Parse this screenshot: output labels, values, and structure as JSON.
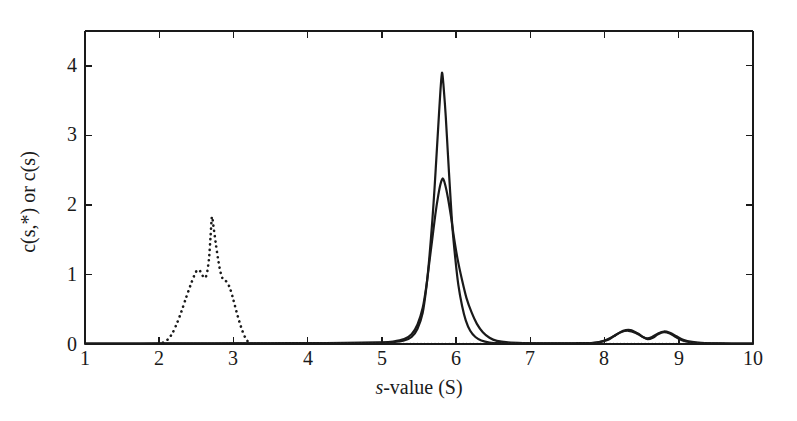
{
  "figure": {
    "background_color": "#ffffff",
    "axis_color": "#1a1a1a",
    "curve_color": "#1a1a1a"
  },
  "chart_data": {
    "type": "line",
    "title": "",
    "xlabel": "s-value (S)",
    "xlabel_italic_prefix": "s",
    "xlabel_rest": "-value (S)",
    "ylabel": "c(s,*) or c(s)",
    "xlim": [
      1,
      10
    ],
    "ylim": [
      0,
      4.5
    ],
    "xticks": [
      1,
      2,
      3,
      4,
      5,
      6,
      7,
      8,
      9,
      10
    ],
    "yticks": [
      0,
      1,
      2,
      3,
      4
    ],
    "xtick_labels": [
      "1",
      "2",
      "3",
      "4",
      "5",
      "6",
      "7",
      "8",
      "9",
      "10"
    ],
    "ytick_labels": [
      "0",
      "1",
      "2",
      "3",
      "4"
    ],
    "grid": false,
    "legend_position": "none",
    "tick_direction": "in",
    "frame": "box",
    "series": [
      {
        "name": "c(s*) distribution — tall solid",
        "style": "solid",
        "linewidth": 2.2,
        "color": "#1a1a1a",
        "peak_x": 5.81,
        "peak_y": 3.9,
        "points": [
          [
            1.0,
            0.004
          ],
          [
            1.5,
            0.005
          ],
          [
            2.0,
            0.006
          ],
          [
            2.5,
            0.007
          ],
          [
            3.0,
            0.008
          ],
          [
            3.5,
            0.009
          ],
          [
            4.0,
            0.01
          ],
          [
            4.5,
            0.012
          ],
          [
            5.0,
            0.018
          ],
          [
            5.15,
            0.025
          ],
          [
            5.3,
            0.05
          ],
          [
            5.4,
            0.1
          ],
          [
            5.48,
            0.22
          ],
          [
            5.55,
            0.45
          ],
          [
            5.6,
            0.82
          ],
          [
            5.64,
            1.25
          ],
          [
            5.68,
            1.78
          ],
          [
            5.71,
            2.25
          ],
          [
            5.74,
            2.78
          ],
          [
            5.77,
            3.32
          ],
          [
            5.79,
            3.66
          ],
          [
            5.81,
            3.9
          ],
          [
            5.83,
            3.72
          ],
          [
            5.86,
            3.28
          ],
          [
            5.89,
            2.72
          ],
          [
            5.92,
            2.18
          ],
          [
            5.95,
            1.68
          ],
          [
            5.99,
            1.22
          ],
          [
            6.03,
            0.85
          ],
          [
            6.08,
            0.55
          ],
          [
            6.13,
            0.34
          ],
          [
            6.19,
            0.19
          ],
          [
            6.26,
            0.1
          ],
          [
            6.34,
            0.05
          ],
          [
            6.45,
            0.022
          ],
          [
            6.6,
            0.012
          ],
          [
            6.9,
            0.008
          ],
          [
            7.3,
            0.008
          ],
          [
            7.7,
            0.01
          ],
          [
            7.9,
            0.02
          ],
          [
            8.05,
            0.06
          ],
          [
            8.15,
            0.13
          ],
          [
            8.25,
            0.19
          ],
          [
            8.35,
            0.2
          ],
          [
            8.45,
            0.15
          ],
          [
            8.52,
            0.1
          ],
          [
            8.58,
            0.07
          ],
          [
            8.65,
            0.09
          ],
          [
            8.72,
            0.14
          ],
          [
            8.8,
            0.17
          ],
          [
            8.88,
            0.15
          ],
          [
            8.96,
            0.1
          ],
          [
            9.05,
            0.05
          ],
          [
            9.15,
            0.025
          ],
          [
            9.3,
            0.012
          ],
          [
            9.5,
            0.008
          ],
          [
            9.75,
            0.006
          ],
          [
            10.0,
            0.005
          ]
        ]
      },
      {
        "name": "c(s) distribution — short solid",
        "style": "solid",
        "linewidth": 2.2,
        "color": "#1a1a1a",
        "peak_x": 5.82,
        "peak_y": 2.38,
        "points": [
          [
            1.0,
            0.006
          ],
          [
            1.5,
            0.007
          ],
          [
            2.0,
            0.008
          ],
          [
            2.5,
            0.009
          ],
          [
            3.0,
            0.01
          ],
          [
            3.5,
            0.011
          ],
          [
            4.0,
            0.013
          ],
          [
            4.5,
            0.016
          ],
          [
            5.0,
            0.024
          ],
          [
            5.15,
            0.035
          ],
          [
            5.3,
            0.07
          ],
          [
            5.4,
            0.14
          ],
          [
            5.48,
            0.28
          ],
          [
            5.55,
            0.52
          ],
          [
            5.6,
            0.84
          ],
          [
            5.64,
            1.18
          ],
          [
            5.68,
            1.52
          ],
          [
            5.72,
            1.86
          ],
          [
            5.76,
            2.14
          ],
          [
            5.79,
            2.3
          ],
          [
            5.82,
            2.38
          ],
          [
            5.85,
            2.3
          ],
          [
            5.89,
            2.1
          ],
          [
            5.93,
            1.84
          ],
          [
            5.97,
            1.54
          ],
          [
            6.02,
            1.22
          ],
          [
            6.08,
            0.92
          ],
          [
            6.14,
            0.66
          ],
          [
            6.21,
            0.45
          ],
          [
            6.28,
            0.29
          ],
          [
            6.36,
            0.17
          ],
          [
            6.45,
            0.09
          ],
          [
            6.55,
            0.045
          ],
          [
            6.7,
            0.022
          ],
          [
            6.9,
            0.013
          ],
          [
            7.2,
            0.01
          ],
          [
            7.6,
            0.011
          ],
          [
            7.85,
            0.018
          ],
          [
            8.0,
            0.05
          ],
          [
            8.12,
            0.11
          ],
          [
            8.22,
            0.17
          ],
          [
            8.32,
            0.19
          ],
          [
            8.42,
            0.16
          ],
          [
            8.5,
            0.11
          ],
          [
            8.57,
            0.08
          ],
          [
            8.64,
            0.1
          ],
          [
            8.72,
            0.15
          ],
          [
            8.8,
            0.18
          ],
          [
            8.88,
            0.16
          ],
          [
            8.97,
            0.11
          ],
          [
            9.06,
            0.06
          ],
          [
            9.18,
            0.03
          ],
          [
            9.35,
            0.014
          ],
          [
            9.6,
            0.008
          ],
          [
            9.85,
            0.006
          ],
          [
            10.0,
            0.005
          ]
        ]
      },
      {
        "name": "dotted distribution",
        "style": "dotted",
        "linewidth": 2.2,
        "color": "#1a1a1a",
        "peak_x": 2.71,
        "peak_y": 1.83,
        "points": [
          [
            2.05,
            0.02
          ],
          [
            2.12,
            0.07
          ],
          [
            2.18,
            0.16
          ],
          [
            2.24,
            0.3
          ],
          [
            2.3,
            0.47
          ],
          [
            2.36,
            0.66
          ],
          [
            2.42,
            0.84
          ],
          [
            2.47,
            0.98
          ],
          [
            2.51,
            1.06
          ],
          [
            2.55,
            1.05
          ],
          [
            2.58,
            0.99
          ],
          [
            2.61,
            0.95
          ],
          [
            2.64,
            1.0
          ],
          [
            2.67,
            1.22
          ],
          [
            2.69,
            1.52
          ],
          [
            2.71,
            1.83
          ],
          [
            2.73,
            1.7
          ],
          [
            2.76,
            1.46
          ],
          [
            2.79,
            1.24
          ],
          [
            2.82,
            1.06
          ],
          [
            2.85,
            0.95
          ],
          [
            2.88,
            0.92
          ],
          [
            2.92,
            0.88
          ],
          [
            2.96,
            0.78
          ],
          [
            3.0,
            0.63
          ],
          [
            3.04,
            0.47
          ],
          [
            3.08,
            0.32
          ],
          [
            3.12,
            0.19
          ],
          [
            3.16,
            0.09
          ],
          [
            3.2,
            0.03
          ],
          [
            3.24,
            0.01
          ]
        ]
      },
      {
        "name": "baseline dotted tail",
        "style": "dotted-flat",
        "linewidth": 1.6,
        "color": "#555555",
        "points": [
          [
            1.0,
            0.005
          ],
          [
            2.0,
            0.005
          ],
          [
            3.3,
            0.005
          ],
          [
            4.0,
            0.005
          ],
          [
            5.0,
            0.005
          ],
          [
            6.5,
            0.005
          ],
          [
            8.0,
            0.005
          ],
          [
            9.0,
            0.005
          ],
          [
            10.0,
            0.005
          ]
        ]
      }
    ]
  }
}
